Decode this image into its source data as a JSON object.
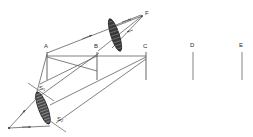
{
  "figure": {
    "type": "optical-ray-diagram",
    "background_color": "#ffffff",
    "line_color": "#4a4a4a",
    "label_color": "#2b2b2b",
    "lens_fill_color": "#3a3a3a"
  },
  "labels": {
    "A": "A",
    "B": "B",
    "C": "C",
    "D": "D",
    "E": "E",
    "F": "F",
    "S1": "S",
    "S1_sub": "1",
    "S2": "S",
    "S2_sub": "2"
  },
  "screens": [
    {
      "name": "A",
      "label": "A",
      "x": 47,
      "y_top": 52,
      "y_bottom": 80
    },
    {
      "name": "B",
      "label": "B",
      "x": 97,
      "y_top": 52,
      "y_bottom": 80
    },
    {
      "name": "C",
      "label": "C",
      "x": 146,
      "y_top": 52,
      "y_bottom": 80
    },
    {
      "name": "D",
      "label": "D",
      "x": 193,
      "y_top": 52,
      "y_bottom": 80
    },
    {
      "name": "E",
      "label": "E",
      "x": 242,
      "y_top": 52,
      "y_bottom": 80
    }
  ],
  "label_positions": {
    "A": {
      "x": 44,
      "y": 43
    },
    "B": {
      "x": 94,
      "y": 43
    },
    "C": {
      "x": 143,
      "y": 43
    },
    "D": {
      "x": 190,
      "y": 42
    },
    "E": {
      "x": 239,
      "y": 42
    },
    "F": {
      "x": 145,
      "y": 11
    },
    "S1": {
      "x": 40,
      "y": 86
    },
    "S2": {
      "x": 57,
      "y": 117
    }
  },
  "lenses": [
    {
      "name": "upper-lens",
      "cx": 115,
      "cy": 35,
      "half_length": 17,
      "half_width": 4.2,
      "angle_deg": 72,
      "hatch_count": 9
    },
    {
      "name": "lower-lens",
      "cx": 43,
      "cy": 108,
      "half_length": 17,
      "half_width": 4.6,
      "angle_deg": 70,
      "hatch_count": 11
    }
  ],
  "axis_lines": [
    {
      "name": "s1-axis",
      "x1": 30,
      "y1": 84,
      "x2": 53,
      "y2": 100
    },
    {
      "name": "s2-axis",
      "x1": 38,
      "y1": 115,
      "x2": 62,
      "y2": 131
    }
  ],
  "rays": [
    {
      "name": "ray-source-to-lens-upper",
      "x1": 9,
      "y1": 128,
      "x2": 34,
      "y2": 98,
      "arrow_at": 0.55
    },
    {
      "name": "ray-source-to-lens-lower",
      "x1": 9,
      "y1": 128,
      "x2": 48,
      "y2": 125,
      "arrow_at": 0.62
    },
    {
      "name": "ray-lens-to-A",
      "x1": 36,
      "y1": 99,
      "x2": 47,
      "y2": 54,
      "arrow_at": 0.0
    },
    {
      "name": "ray-lensTop-up-to-B",
      "x1": 37,
      "y1": 99,
      "x2": 100,
      "y2": 52,
      "arrow_at": 0.55
    },
    {
      "name": "ray-A-to-F",
      "x1": 47,
      "y1": 54,
      "x2": 143,
      "y2": 16,
      "arrow_at": 0.45
    },
    {
      "name": "ray-B-to-F",
      "x1": 99,
      "y1": 52,
      "x2": 143,
      "y2": 16,
      "arrow_at": 0.62
    },
    {
      "name": "ray-lensUpper-to-F",
      "x1": 118,
      "y1": 24,
      "x2": 141,
      "y2": 16,
      "arrow_at": 0.7
    },
    {
      "name": "ray-A-to-C",
      "x1": 47,
      "y1": 56,
      "x2": 146,
      "y2": 56,
      "arrow_at": 0.0
    },
    {
      "name": "ray-B-down-long",
      "x1": 97,
      "y1": 56,
      "x2": 48,
      "y2": 80,
      "arrow_at": 0.0
    },
    {
      "name": "ray-C-to-lens",
      "x1": 146,
      "y1": 58,
      "x2": 52,
      "y2": 110,
      "arrow_at": 0.0
    },
    {
      "name": "ray-lensbottom-to-C",
      "x1": 55,
      "y1": 122,
      "x2": 146,
      "y2": 60,
      "arrow_at": 0.0
    }
  ],
  "source_point": {
    "name": "source",
    "x": 9,
    "y": 128
  },
  "focus_point": {
    "name": "focus-F",
    "x": 143,
    "y": 16
  }
}
